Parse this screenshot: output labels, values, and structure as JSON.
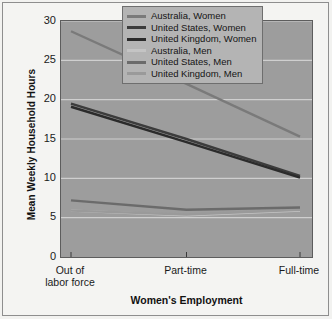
{
  "chart_data": {
    "type": "line",
    "title": "",
    "xlabel": "Women's Employment",
    "ylabel": "Mean Weekly Household Hours",
    "categories": [
      "Out of\nlabor force",
      "Part-time",
      "Full-time"
    ],
    "category_labels": [
      {
        "line1": "Out of",
        "line2": "labor force"
      },
      {
        "line1": "Part-time",
        "line2": ""
      },
      {
        "line1": "Full-time",
        "line2": ""
      }
    ],
    "ylim": [
      0,
      30
    ],
    "yticks": [
      30,
      25,
      20,
      15,
      10,
      5,
      0
    ],
    "grid": true,
    "grid_axis": "y",
    "legend_position": "top-right",
    "series": [
      {
        "name": "Australia, Women",
        "color": "#7a7a7a",
        "values": [
          28.7,
          22.0,
          15.3
        ]
      },
      {
        "name": "United States, Women",
        "color": "#3c3c3c",
        "values": [
          19.5,
          15.0,
          10.3
        ]
      },
      {
        "name": "United Kingdom, Women",
        "color": "#2b2b2b",
        "values": [
          19.1,
          14.6,
          10.1
        ]
      },
      {
        "name": "Australia, Men",
        "color": "#c4c4c4",
        "values": [
          5.9,
          5.3,
          5.9
        ]
      },
      {
        "name": "United States, Men",
        "color": "#6b6b6b",
        "values": [
          7.2,
          6.0,
          6.3
        ]
      },
      {
        "name": "United Kingdom, Men",
        "color": "#9a9a9a",
        "values": [
          5.9,
          5.4,
          6.0
        ]
      }
    ]
  },
  "colors": {
    "plot_background": "#9d9d9d",
    "figure_background": "#f4f4f2",
    "gridline": "#cfcfcf",
    "axis": "#3a3a3a",
    "legend_background": "#b4b4b4",
    "text": "#1a1a1a"
  }
}
